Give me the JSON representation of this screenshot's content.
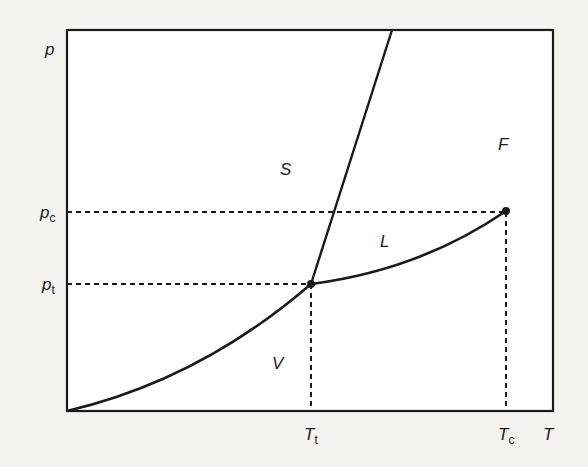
{
  "axes": {
    "y_label": "p",
    "x_label": "T"
  },
  "ticks": {
    "y": [
      {
        "base": "p",
        "sub": "c",
        "name": "critical pressure"
      },
      {
        "base": "p",
        "sub": "t",
        "name": "triple-point pressure"
      }
    ],
    "x": [
      {
        "base": "T",
        "sub": "t",
        "name": "triple-point temperature"
      },
      {
        "base": "T",
        "sub": "c",
        "name": "critical temperature"
      }
    ]
  },
  "regions": {
    "solid": "S",
    "liquid": "L",
    "vapor": "V",
    "fluid": "F"
  },
  "points": {
    "triple_point": "triple point (Tt, pt)",
    "critical_point": "critical point (Tc, pc)"
  },
  "curves": {
    "sublimation": "sublimation curve (S–V)",
    "melting": "melting curve (S–L)",
    "vaporization": "vaporization curve (L–V)"
  },
  "colors": {
    "line": "#1a1a1a",
    "background": "#f4f3f0",
    "plot_background": "#ffffff"
  }
}
